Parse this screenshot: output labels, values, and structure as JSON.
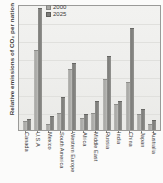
{
  "chart_data": {
    "type": "bar",
    "title": "",
    "subtitle": "",
    "xlabel": "",
    "ylabel": "Relative emissions of CO₂ per nation",
    "ylim": [
      0,
      100
    ],
    "grid": true,
    "legend_position": "top-center",
    "axis_tick_labels_y": [],
    "categories": [
      "Canada",
      "U.S.A",
      "Mexico",
      "South America",
      "Western Europe",
      "Africa",
      "Middle East",
      "Russia",
      "India",
      "China",
      "Japan",
      "Australia"
    ],
    "series": [
      {
        "name": "2000",
        "color": "#a8a8a5",
        "values": [
          6,
          63,
          4,
          13,
          48,
          9,
          13,
          40,
          20,
          37,
          12,
          4
        ]
      },
      {
        "name": "2025",
        "color": "#7d7d7a",
        "values": [
          8,
          96,
          10,
          25,
          52,
          12,
          22,
          58,
          22,
          80,
          16,
          7
        ]
      }
    ]
  },
  "figure": {
    "y_axis_title": "Relative emissions of CO₂ per nation"
  },
  "legend": {
    "entries": [
      {
        "label": "2000"
      },
      {
        "label": "2025"
      }
    ]
  }
}
